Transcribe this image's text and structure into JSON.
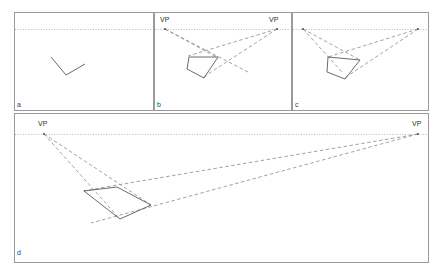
{
  "figure": {
    "background": "#ffffff",
    "border_color": "#9a9a9a",
    "horizon_color": "#b9b9b9",
    "construction_color": "#8a8a8a",
    "shape_color": "#5a5a5a",
    "point_color": "#555555",
    "label_color": "#3a3a3a"
  },
  "panels": [
    {
      "id": "a",
      "label": "a",
      "label_pos": {
        "x": 17,
        "y": 101
      },
      "frame": {
        "x": 14,
        "y": 12,
        "w": 139,
        "h": 98
      },
      "horizon": {
        "x1": 15,
        "y1": 29,
        "x2": 152,
        "y2": 29
      },
      "vanishing_points": [],
      "vp_labels": [],
      "construction_lines": [],
      "shape": {
        "type": "polyline",
        "points": "51,57 66,75 85,64"
      }
    },
    {
      "id": "b",
      "label": "b",
      "label_pos": {
        "x": 157,
        "y": 101
      },
      "frame": {
        "x": 154,
        "y": 12,
        "w": 137,
        "h": 98
      },
      "horizon": {
        "x1": 155,
        "y1": 29,
        "x2": 290,
        "y2": 29
      },
      "vanishing_points": [
        {
          "name": "vp-left",
          "x": 165,
          "y": 29
        },
        {
          "name": "vp-right",
          "x": 277,
          "y": 29
        }
      ],
      "vp_labels": [
        {
          "text": "VP",
          "x": 160,
          "y": 16
        },
        {
          "text": "VP",
          "x": 269,
          "y": 16
        }
      ],
      "construction_lines": [
        {
          "x1": 165,
          "y1": 29,
          "x2": 218,
          "y2": 58
        },
        {
          "x1": 165,
          "y1": 29,
          "x2": 248,
          "y2": 72
        },
        {
          "x1": 277,
          "y1": 29,
          "x2": 188,
          "y2": 56
        },
        {
          "x1": 277,
          "y1": 29,
          "x2": 202,
          "y2": 78
        }
      ],
      "shape": {
        "type": "polygon",
        "points": "189,57 218,57 204,78 187,69"
      }
    },
    {
      "id": "c",
      "label": "c",
      "label_pos": {
        "x": 295,
        "y": 101
      },
      "frame": {
        "x": 292,
        "y": 12,
        "w": 136,
        "h": 98
      },
      "horizon": {
        "x1": 293,
        "y1": 29,
        "x2": 427,
        "y2": 29
      },
      "vanishing_points": [
        {
          "name": "vp-left",
          "x": 303,
          "y": 29
        },
        {
          "name": "vp-right",
          "x": 418,
          "y": 29
        }
      ],
      "vp_labels": [],
      "construction_lines": [
        {
          "x1": 303,
          "y1": 29,
          "x2": 360,
          "y2": 60
        },
        {
          "x1": 303,
          "y1": 29,
          "x2": 342,
          "y2": 72
        },
        {
          "x1": 418,
          "y1": 29,
          "x2": 328,
          "y2": 57
        },
        {
          "x1": 418,
          "y1": 29,
          "x2": 343,
          "y2": 79
        }
      ],
      "shape": {
        "type": "polygon",
        "points": "328,57 360,60 345,79 327,72"
      }
    },
    {
      "id": "d",
      "label": "d",
      "label_pos": {
        "x": 17,
        "y": 249
      },
      "frame": {
        "x": 14,
        "y": 113,
        "w": 414,
        "h": 149
      },
      "horizon": {
        "x1": 15,
        "y1": 134,
        "x2": 427,
        "y2": 134
      },
      "vanishing_points": [
        {
          "name": "vp-left",
          "x": 44,
          "y": 134
        },
        {
          "name": "vp-right",
          "x": 418,
          "y": 134
        }
      ],
      "vp_labels": [
        {
          "text": "VP",
          "x": 38,
          "y": 120
        },
        {
          "text": "VP",
          "x": 412,
          "y": 120
        }
      ],
      "construction_lines": [
        {
          "x1": 44,
          "y1": 134,
          "x2": 119,
          "y2": 218
        },
        {
          "x1": 44,
          "y1": 134,
          "x2": 151,
          "y2": 205
        },
        {
          "x1": 418,
          "y1": 134,
          "x2": 82,
          "y2": 191
        },
        {
          "x1": 418,
          "y1": 134,
          "x2": 91,
          "y2": 223
        }
      ],
      "shape": {
        "type": "polygon",
        "points": "84,191 117,187 151,205 120,219"
      }
    }
  ]
}
